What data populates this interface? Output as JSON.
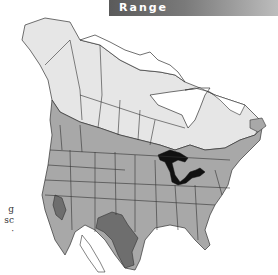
{
  "header": {
    "title": "Range"
  },
  "side_text_fragments": [
    "g",
    "sc",
    "·"
  ],
  "map": {
    "region": "North America",
    "legend_colors": {
      "summer_breeding": "#e6e6e6",
      "year_round": "#a8a8a8",
      "southwest_range": "#6e6e6e",
      "great_lakes_water": "#111111",
      "borders": "#333333",
      "background": "#ffffff"
    }
  }
}
